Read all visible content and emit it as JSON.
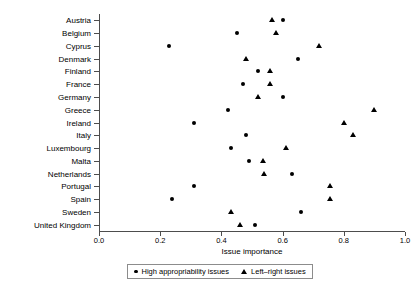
{
  "chart_data": {
    "type": "scatter",
    "title": "",
    "xlabel": "Issue importance",
    "ylabel": "",
    "xlim": [
      0.0,
      1.0
    ],
    "xticks": [
      "0.0",
      "0.2",
      "0.4",
      "0.6",
      "0.8",
      "1.0"
    ],
    "xtick_values": [
      0.0,
      0.2,
      0.4,
      0.6,
      0.8,
      1.0
    ],
    "grid": false,
    "legend_position": "bottom-center",
    "categories": [
      "Austria",
      "Belgium",
      "Cyprus",
      "Denmark",
      "Finland",
      "France",
      "Germany",
      "Greece",
      "Ireland",
      "Italy",
      "Luxembourg",
      "Malta",
      "Netherlands",
      "Portugal",
      "Spain",
      "Sweden",
      "United Kingdom"
    ],
    "series": [
      {
        "name": "High appropriability issues",
        "marker": "circle",
        "values": [
          0.6,
          0.45,
          0.23,
          0.65,
          0.52,
          0.47,
          0.6,
          0.42,
          0.31,
          0.48,
          0.43,
          0.49,
          0.63,
          0.31,
          0.24,
          0.66,
          0.51
        ]
      },
      {
        "name": "Left-right issues",
        "marker": "triangle",
        "values": [
          0.565,
          0.58,
          0.72,
          0.48,
          0.56,
          0.56,
          0.52,
          0.9,
          0.8,
          0.83,
          0.61,
          0.535,
          0.54,
          0.755,
          0.755,
          0.43,
          0.46
        ]
      }
    ]
  },
  "legend": {
    "entries": [
      {
        "label": "High appropriability issues",
        "symbol": "circle-marker"
      },
      {
        "label": "Left–right issues",
        "symbol": "triangle-marker"
      }
    ]
  },
  "axis": {
    "x_title": "Issue importance"
  }
}
